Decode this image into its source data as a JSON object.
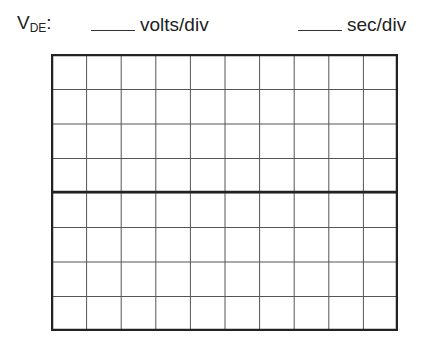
{
  "header": {
    "signal_label": "V",
    "signal_subscript": "DE",
    "signal_suffix": ":",
    "volts_unit": "volts/div",
    "time_unit": "sec/div"
  },
  "graticule": {
    "columns": 10,
    "rows": 8,
    "line_color": "#555555",
    "border_color": "#222222"
  }
}
